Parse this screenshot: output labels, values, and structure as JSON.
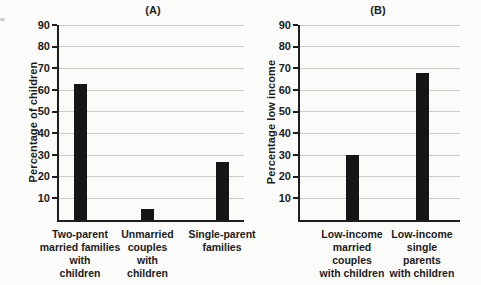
{
  "figure": {
    "panel_a_title": "(A)",
    "panel_b_title": "(B)"
  },
  "style": {
    "background": "#fbfbf9",
    "bar_color": "#161616",
    "axis_color": "#1d1d1d",
    "gridline_color": "#cdccc9",
    "text_color": "#1b1b1b"
  },
  "chart_data": [
    {
      "type": "bar",
      "title": "(A)",
      "xlabel": "",
      "ylabel": "Percentage of children",
      "ylim": [
        0,
        90
      ],
      "yticks": [
        10,
        20,
        30,
        40,
        50,
        60,
        70,
        80,
        90
      ],
      "grid": true,
      "legend": false,
      "categories": [
        "Two-parent married families with children",
        "Unmarried couples with children",
        "Single-parent families"
      ],
      "category_lines": [
        [
          "Two-parent",
          "married families",
          "with",
          "children"
        ],
        [
          "Unmarried",
          "couples",
          "with",
          "children"
        ],
        [
          "Single-parent",
          "families"
        ]
      ],
      "values": [
        63,
        5,
        27
      ],
      "bar_color": "#161616"
    },
    {
      "type": "bar",
      "title": "(B)",
      "xlabel": "",
      "ylabel": "Percentage low income",
      "ylim": [
        0,
        90
      ],
      "yticks": [
        10,
        20,
        30,
        40,
        50,
        60,
        70,
        80,
        90
      ],
      "grid": true,
      "legend": false,
      "categories": [
        "Low-income married couples with children",
        "Low-income single parents with children"
      ],
      "category_lines": [
        [
          "Low-income",
          "married",
          "couples",
          "with children"
        ],
        [
          "Low-income",
          "single",
          "parents",
          "with children"
        ]
      ],
      "values": [
        30,
        68
      ],
      "bar_color": "#161616"
    }
  ]
}
